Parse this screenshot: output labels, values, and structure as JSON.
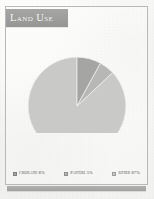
{
  "figure": {
    "title": "Land Use",
    "frame_color": "#b9b9b7",
    "banner_color": "#9d9d9b",
    "background_color": "#f7f7f5"
  },
  "chart_data": {
    "type": "pie",
    "title": "Land Use",
    "categories": [
      "Cropland",
      "Pasture",
      "Other"
    ],
    "values": [
      8,
      5,
      87
    ],
    "unit": "%",
    "labels": [
      "Cropland 8%",
      "Pasture 5%",
      "Other 87%"
    ],
    "colors": [
      "#a5a5a3",
      "#b7b7b5",
      "#c9c9c7"
    ],
    "start_angle_deg": 0,
    "direction": "clockwise",
    "legend_position": "bottom",
    "grid": false,
    "data_labels": false,
    "xlabel": "",
    "ylabel": ""
  },
  "legend": {
    "items": [
      {
        "label": "Cropland 8%",
        "color": "#a5a5a3"
      },
      {
        "label": "Pasture 5%",
        "color": "#b7b7b5"
      },
      {
        "label": "Other 87%",
        "color": "#c9c9c7"
      }
    ]
  }
}
